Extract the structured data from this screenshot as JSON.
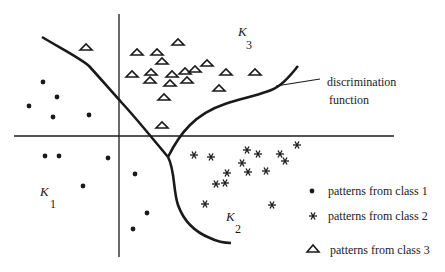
{
  "diagram": {
    "type": "feature-space classification diagram",
    "colors": {
      "ink": "#1a1a1a",
      "background": "#ffffff"
    },
    "regions": [
      {
        "id": "K1",
        "letter": "K",
        "subscript": "1"
      },
      {
        "id": "K2",
        "letter": "K",
        "subscript": "2"
      },
      {
        "id": "K3",
        "letter": "K",
        "subscript": "3"
      }
    ],
    "annotation": {
      "line1": "discrimination",
      "line2": "function"
    },
    "legend": [
      {
        "symbol": "dot",
        "label": "patterns from class 1"
      },
      {
        "symbol": "asterisk",
        "label": "patterns from class 2"
      },
      {
        "symbol": "triangle",
        "label": "patterns from class 3"
      }
    ],
    "points": {
      "class1": [
        [
          43,
          82
        ],
        [
          57,
          97
        ],
        [
          29,
          106
        ],
        [
          53,
          117
        ],
        [
          89,
          115
        ],
        [
          45,
          156
        ],
        [
          59,
          156
        ],
        [
          108,
          158
        ],
        [
          83,
          186
        ],
        [
          135,
          174
        ],
        [
          147,
          213
        ],
        [
          133,
          229
        ]
      ],
      "class2": [
        [
          211,
          157
        ],
        [
          247,
          150
        ],
        [
          297,
          145
        ],
        [
          194,
          155
        ],
        [
          225,
          183
        ],
        [
          242,
          163
        ],
        [
          258,
          154
        ],
        [
          280,
          154
        ],
        [
          227,
          173
        ],
        [
          248,
          172
        ],
        [
          266,
          171
        ],
        [
          285,
          161
        ],
        [
          216,
          184
        ],
        [
          205,
          204
        ],
        [
          272,
          205
        ]
      ],
      "class3": [
        [
          86,
          47
        ],
        [
          137,
          52
        ],
        [
          178,
          42
        ],
        [
          162,
          61
        ],
        [
          157,
          52
        ],
        [
          132,
          74
        ],
        [
          151,
          72
        ],
        [
          172,
          74
        ],
        [
          185,
          71
        ],
        [
          195,
          69
        ],
        [
          207,
          63
        ],
        [
          226,
          72
        ],
        [
          150,
          80
        ],
        [
          170,
          83
        ],
        [
          187,
          80
        ],
        [
          219,
          88
        ],
        [
          164,
          97
        ],
        [
          255,
          72
        ],
        [
          162,
          125
        ]
      ]
    }
  }
}
